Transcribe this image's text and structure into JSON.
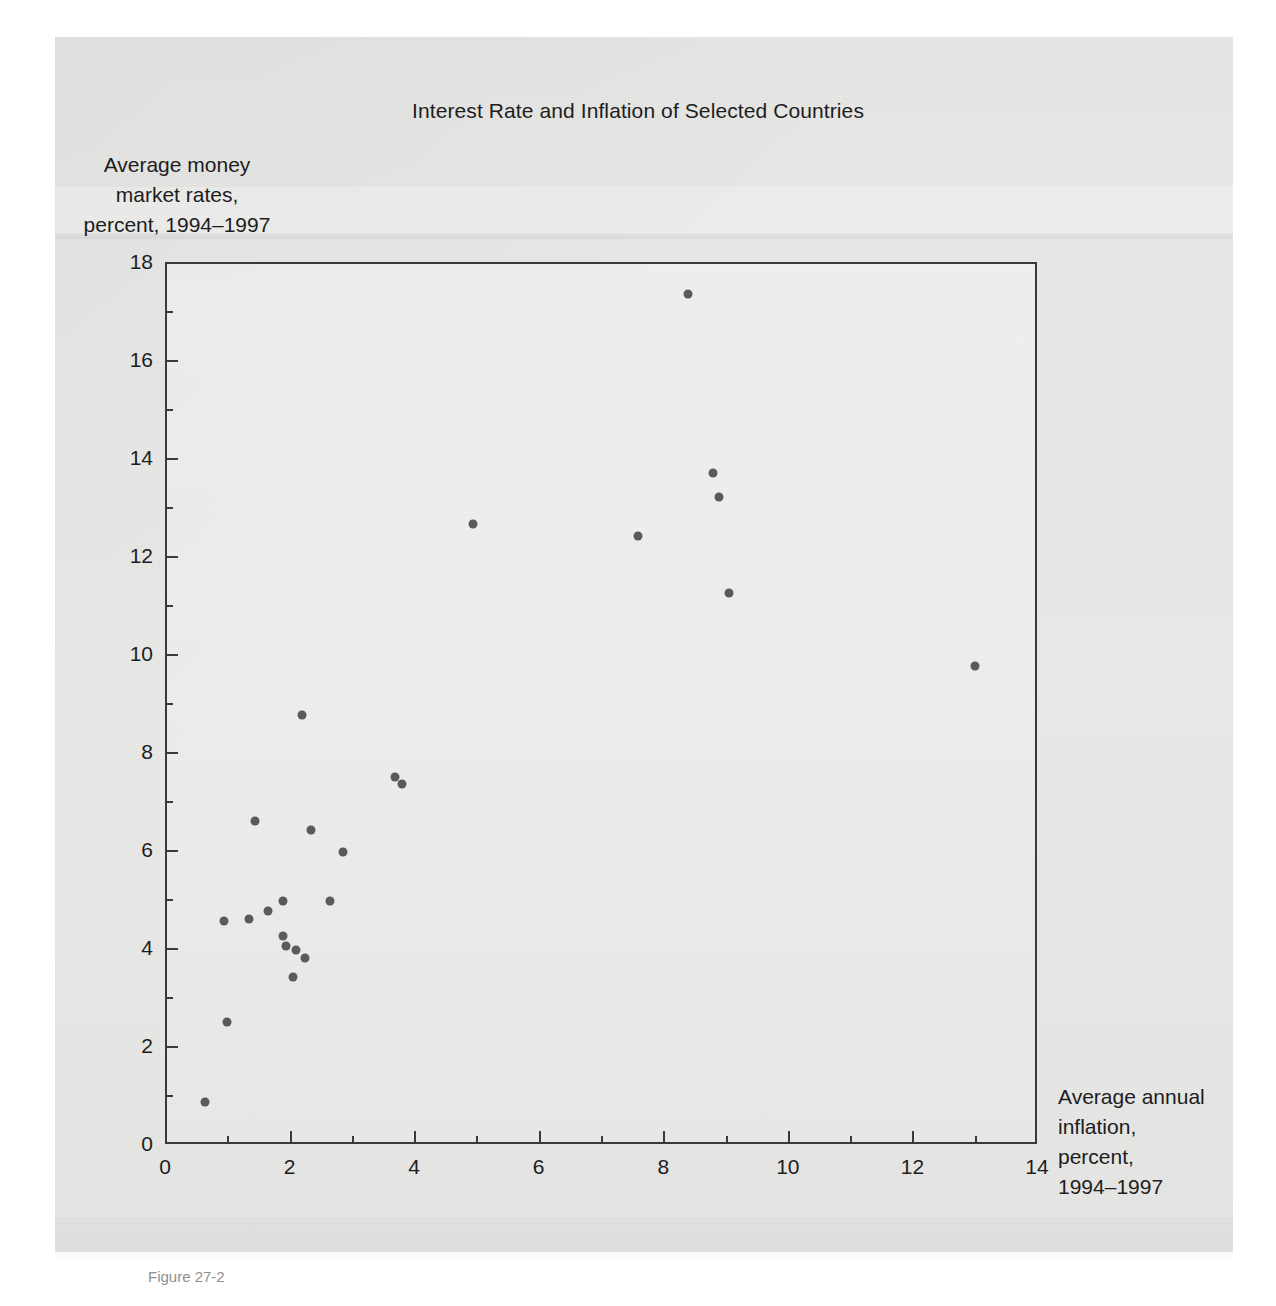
{
  "figure": {
    "caption": "Figure 27-2"
  },
  "chart_data": {
    "type": "scatter",
    "title": "Interest Rate and Inflation of Selected Countries",
    "xlabel": "Average annual inflation, percent, 1994–1997",
    "ylabel": "Average money market rates, percent, 1994–1997",
    "xlabel_lines": [
      "Average annual",
      "inflation,",
      "percent,",
      "1994–1997"
    ],
    "ylabel_lines": [
      "Average money",
      "market rates,",
      "percent, 1994–1997"
    ],
    "xlim": [
      0,
      14
    ],
    "ylim": [
      0,
      18
    ],
    "xticks": [
      0,
      2,
      4,
      6,
      8,
      10,
      12,
      14
    ],
    "yticks": [
      0,
      2,
      4,
      6,
      8,
      10,
      12,
      14,
      16,
      18
    ],
    "x_minor_step": 1,
    "y_minor_step": 1,
    "grid": false,
    "legend": null,
    "marker_color": "#5a5a5a",
    "axis_color": "#3a3a3a",
    "points": [
      {
        "x": 0.65,
        "y": 0.85
      },
      {
        "x": 1.0,
        "y": 2.5
      },
      {
        "x": 0.95,
        "y": 4.55
      },
      {
        "x": 1.35,
        "y": 4.6
      },
      {
        "x": 1.45,
        "y": 6.6
      },
      {
        "x": 1.65,
        "y": 4.75
      },
      {
        "x": 1.9,
        "y": 4.95
      },
      {
        "x": 1.9,
        "y": 4.25
      },
      {
        "x": 1.95,
        "y": 4.05
      },
      {
        "x": 2.05,
        "y": 3.4
      },
      {
        "x": 2.1,
        "y": 3.95
      },
      {
        "x": 2.2,
        "y": 8.75
      },
      {
        "x": 2.25,
        "y": 3.8
      },
      {
        "x": 2.35,
        "y": 6.4
      },
      {
        "x": 2.65,
        "y": 4.95
      },
      {
        "x": 2.85,
        "y": 5.95
      },
      {
        "x": 3.7,
        "y": 7.5
      },
      {
        "x": 3.8,
        "y": 7.35
      },
      {
        "x": 4.95,
        "y": 12.65
      },
      {
        "x": 7.6,
        "y": 12.4
      },
      {
        "x": 8.4,
        "y": 17.35
      },
      {
        "x": 8.8,
        "y": 13.7
      },
      {
        "x": 8.9,
        "y": 13.2
      },
      {
        "x": 9.05,
        "y": 11.25
      },
      {
        "x": 13.0,
        "y": 9.75
      }
    ]
  }
}
